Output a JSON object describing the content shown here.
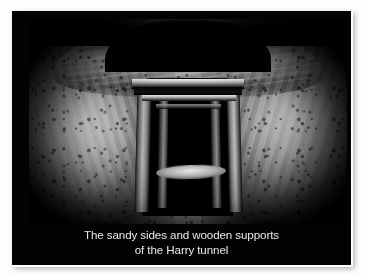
{
  "figure": {
    "kind": "captioned-photograph",
    "frame": {
      "outer_border_color": "#fdfdfd",
      "card_background_color": "#030303"
    },
    "photo": {
      "palette": {
        "sand_highlight": "#e6e0d6",
        "sand_midtone": "#a49c8f",
        "sand_shadow": "#5d564c",
        "timber_highlight": "#efece4",
        "tunnel_dark": "#000000"
      },
      "elements": [
        {
          "name": "left-sand-wall",
          "label": "Left sandy wall"
        },
        {
          "name": "right-sand-wall",
          "label": "Right sandy wall"
        },
        {
          "name": "roof-arch",
          "label": "Arched sand roof"
        },
        {
          "name": "timber-frame",
          "label": "Wooden shoring frame"
        },
        {
          "name": "tunnel-shaft",
          "label": "Dark tunnel shaft receding"
        },
        {
          "name": "floor-ledge",
          "label": "Sandy floor ledge"
        }
      ]
    }
  },
  "caption": {
    "line1": "The sandy sides and wooden supports",
    "line2": "of the Harry tunnel",
    "color": "#e9e9e9"
  }
}
